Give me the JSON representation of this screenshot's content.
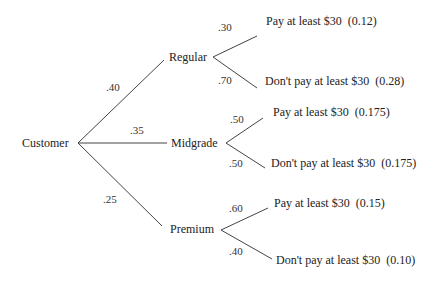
{
  "diagram": {
    "type": "probability-tree",
    "root": {
      "label": "Customer"
    },
    "branches": [
      {
        "label": "Regular",
        "probability": ".40",
        "outcomes": [
          {
            "probability": ".30",
            "label": "Pay at least  $30",
            "joint": "(0.12)"
          },
          {
            "probability": ".70",
            "label": "Don't pay at least $30",
            "joint": "(0.28)"
          }
        ]
      },
      {
        "label": "Midgrade",
        "probability": ".35",
        "outcomes": [
          {
            "probability": ".50",
            "label": "Pay at least $30",
            "joint": "(0.175)"
          },
          {
            "probability": ".50",
            "label": "Don't pay at least $30",
            "joint": "(0.175)"
          }
        ]
      },
      {
        "label": "Premium",
        "probability": ".25",
        "outcomes": [
          {
            "probability": ".60",
            "label": "Pay at least $30",
            "joint": "(0.15)"
          },
          {
            "probability": ".40",
            "label": "Don't pay at least $30",
            "joint": "(0.10)"
          }
        ]
      }
    ],
    "line_color": "#444444",
    "text_color": "#222222"
  }
}
